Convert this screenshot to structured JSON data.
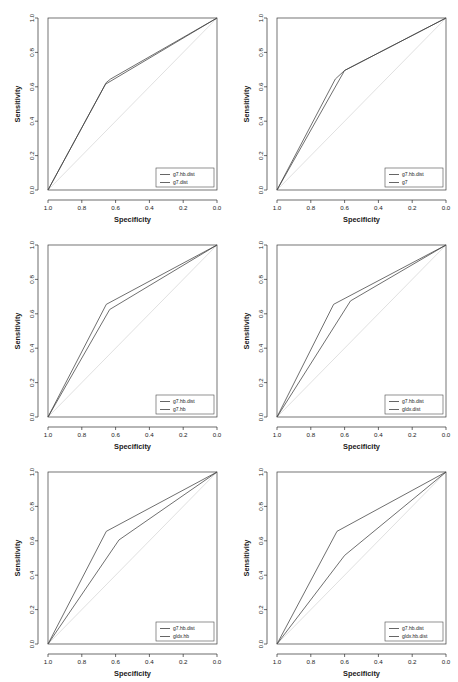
{
  "watermark": "",
  "figure": {
    "panel_count": 6,
    "columns": 2,
    "rows": 3
  },
  "axes": {
    "xlabel": "Specificity",
    "ylabel": "Sensitivity",
    "xticks": [
      "1.0",
      "0.8",
      "0.6",
      "0.4",
      "0.2",
      "0.0"
    ],
    "yticks": [
      "0.0",
      "0.2",
      "0.4",
      "0.6",
      "0.8",
      "1.0"
    ],
    "xlim": [
      1.0,
      0.0
    ],
    "ylim": [
      0.0,
      1.0
    ],
    "x_reversed": true,
    "grid": false
  },
  "chart_data": [
    {
      "type": "line",
      "title": "",
      "xlabel": "Specificity",
      "ylabel": "Sensitivity",
      "xlim": [
        1.0,
        0.0
      ],
      "ylim": [
        0.0,
        1.0
      ],
      "legend_position": "bottom-right",
      "reference_line": {
        "name": "chance",
        "points": [
          [
            1.0,
            0.0
          ],
          [
            0.0,
            1.0
          ]
        ]
      },
      "series": [
        {
          "name": "g7.hb.dist",
          "points": [
            [
              1.0,
              0.0
            ],
            [
              0.655,
              0.625
            ],
            [
              0.63,
              0.645
            ],
            [
              0.0,
              1.0
            ]
          ]
        },
        {
          "name": "g7.dist",
          "points": [
            [
              1.0,
              0.0
            ],
            [
              0.66,
              0.615
            ],
            [
              0.0,
              1.0
            ]
          ]
        }
      ]
    },
    {
      "type": "line",
      "title": "",
      "xlabel": "Specificity",
      "ylabel": "Sensitivity",
      "xlim": [
        1.0,
        0.0
      ],
      "ylim": [
        0.0,
        1.0
      ],
      "legend_position": "bottom-right",
      "reference_line": {
        "name": "chance",
        "points": [
          [
            1.0,
            0.0
          ],
          [
            0.0,
            1.0
          ]
        ]
      },
      "series": [
        {
          "name": "g7.hb.dist",
          "points": [
            [
              1.0,
              0.0
            ],
            [
              0.655,
              0.645
            ],
            [
              0.6,
              0.695
            ],
            [
              0.0,
              1.0
            ]
          ]
        },
        {
          "name": "g7",
          "points": [
            [
              1.0,
              0.0
            ],
            [
              0.6,
              0.695
            ],
            [
              0.0,
              1.0
            ]
          ]
        }
      ]
    },
    {
      "type": "line",
      "title": "",
      "xlabel": "Specificity",
      "ylabel": "Sensitivity",
      "xlim": [
        1.0,
        0.0
      ],
      "ylim": [
        0.0,
        1.0
      ],
      "legend_position": "bottom-right",
      "reference_line": {
        "name": "chance",
        "points": [
          [
            1.0,
            0.0
          ],
          [
            0.0,
            1.0
          ]
        ]
      },
      "series": [
        {
          "name": "g7.hb.dist",
          "points": [
            [
              1.0,
              0.0
            ],
            [
              0.655,
              0.655
            ],
            [
              0.0,
              1.0
            ]
          ]
        },
        {
          "name": "g7.hb",
          "points": [
            [
              1.0,
              0.0
            ],
            [
              0.635,
              0.625
            ],
            [
              0.0,
              1.0
            ]
          ]
        }
      ]
    },
    {
      "type": "line",
      "title": "",
      "xlabel": "Specificity",
      "ylabel": "Sensitivity",
      "xlim": [
        1.0,
        0.0
      ],
      "ylim": [
        0.0,
        1.0
      ],
      "legend_position": "bottom-right",
      "reference_line": {
        "name": "chance",
        "points": [
          [
            1.0,
            0.0
          ],
          [
            0.0,
            1.0
          ]
        ]
      },
      "series": [
        {
          "name": "g7.hb.dist",
          "points": [
            [
              1.0,
              0.0
            ],
            [
              0.665,
              0.655
            ],
            [
              0.0,
              1.0
            ]
          ]
        },
        {
          "name": "gldx.dist",
          "points": [
            [
              1.0,
              0.0
            ],
            [
              0.565,
              0.675
            ],
            [
              0.0,
              1.0
            ]
          ]
        }
      ]
    },
    {
      "type": "line",
      "title": "",
      "xlabel": "Specificity",
      "ylabel": "Sensitivity",
      "xlim": [
        1.0,
        0.0
      ],
      "ylim": [
        0.0,
        1.0
      ],
      "legend_position": "bottom-right",
      "reference_line": {
        "name": "chance",
        "points": [
          [
            1.0,
            0.0
          ],
          [
            0.0,
            1.0
          ]
        ]
      },
      "series": [
        {
          "name": "g7.hb.dist",
          "points": [
            [
              1.0,
              0.0
            ],
            [
              0.655,
              0.655
            ],
            [
              0.0,
              1.0
            ]
          ]
        },
        {
          "name": "gldx.hb",
          "points": [
            [
              1.0,
              0.0
            ],
            [
              0.58,
              0.605
            ],
            [
              0.0,
              1.0
            ]
          ]
        }
      ]
    },
    {
      "type": "line",
      "title": "",
      "xlabel": "Specificity",
      "ylabel": "Sensitivity",
      "xlim": [
        1.0,
        0.0
      ],
      "ylim": [
        0.0,
        1.0
      ],
      "legend_position": "bottom-right",
      "reference_line": {
        "name": "chance",
        "points": [
          [
            1.0,
            0.0
          ],
          [
            0.0,
            1.0
          ]
        ]
      },
      "series": [
        {
          "name": "g7.hb.dist",
          "points": [
            [
              1.0,
              0.0
            ],
            [
              0.645,
              0.655
            ],
            [
              0.0,
              1.0
            ]
          ]
        },
        {
          "name": "gldx.hb.dist",
          "points": [
            [
              1.0,
              0.0
            ],
            [
              0.6,
              0.515
            ],
            [
              0.0,
              1.0
            ]
          ]
        }
      ]
    }
  ],
  "colors": {
    "curve": "#3f3f3f",
    "diagonal": "#d8d8d8",
    "axis": "#2b2b2b",
    "text": "#1a1a1a",
    "background": "#ffffff"
  }
}
